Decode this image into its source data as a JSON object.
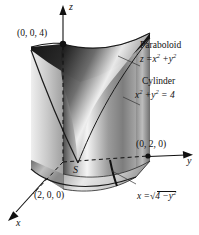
{
  "figure": {
    "kind": "3d-solid-diagram",
    "background_color": "#ffffff",
    "ink_color": "#111111",
    "surface_light": "#f2f2f2",
    "surface_mid": "#9a9a9a",
    "surface_dark": "#2b2b2b"
  },
  "axes": {
    "z": {
      "letter": "z"
    },
    "y": {
      "letter": "y"
    },
    "x": {
      "letter": "x"
    }
  },
  "points": {
    "z_intercept": "(0, 0, 4)",
    "y_intercept": "(0, 2, 0)",
    "x_intercept": "(2, 0, 0)"
  },
  "annotations": {
    "paraboloid": {
      "title": "Paraboloid",
      "equation_lhs": "z =",
      "equation_t1": "x",
      "equation_exp1": "2",
      "equation_plus": "+",
      "equation_t2": "y",
      "equation_exp2": "2"
    },
    "cylinder": {
      "title": "Cylinder",
      "equation_t1": "x",
      "equation_exp1": "2",
      "equation_plus": "+",
      "equation_t2": "y",
      "equation_exp2": "2",
      "equation_rhs": "= 4"
    },
    "boundary_curve": {
      "lhs": "x =",
      "radical": "√",
      "radicand_a": "4 −",
      "radicand_t": "y",
      "radicand_exp": "2"
    },
    "region_label": "S"
  }
}
